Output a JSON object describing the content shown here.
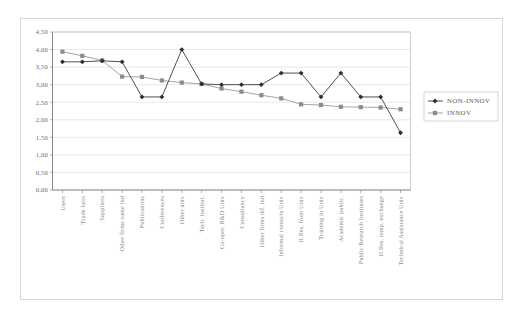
{
  "chart_data": {
    "type": "line",
    "title": "",
    "subtitle": "",
    "xlabel": "",
    "ylabel": "",
    "ylim": [
      0,
      4.5
    ],
    "ytick_labels": [
      "0,00",
      "0,50",
      "1,00",
      "1,50",
      "2,00",
      "2,50",
      "3,00",
      "3,50",
      "4,00",
      "4,50"
    ],
    "ytick_values": [
      0,
      0.5,
      1.0,
      1.5,
      2.0,
      2.5,
      3.0,
      3.5,
      4.0,
      4.5
    ],
    "grid": true,
    "legend_position": "right",
    "decimal_separator": ",",
    "categories": [
      "Users",
      "Trade fairs",
      "Suppliers",
      "Other firms same ind",
      "Publications",
      "Conferences",
      "Other univ",
      "Tech. Institut.",
      "Co-oper. R&D Univ",
      "Consultancy",
      "Other firms dif. ind",
      "Informal contacts Univ",
      "H.Res. from Univ",
      "Training in Univ",
      "Academic public.",
      "Public Research Institutes",
      "H.Res. temp. exchange",
      "Technical Assistance Univ"
    ],
    "series": [
      {
        "name": "NON-INNOV",
        "marker": "diamond",
        "color": "#2e2e2e",
        "values": [
          3.65,
          3.65,
          3.68,
          3.65,
          2.65,
          2.65,
          4.0,
          3.02,
          3.0,
          3.0,
          3.0,
          3.33,
          3.33,
          2.65,
          3.33,
          2.65,
          2.65,
          1.63
        ]
      },
      {
        "name": "INNOV",
        "marker": "square",
        "color": "#8c8c8c",
        "values": [
          3.94,
          3.82,
          3.69,
          3.23,
          3.22,
          3.12,
          3.06,
          3.02,
          2.89,
          2.8,
          2.7,
          2.61,
          2.44,
          2.42,
          2.37,
          2.36,
          2.35,
          2.3
        ]
      }
    ]
  },
  "legend": {
    "entries": [
      {
        "label": "NON-INNOV",
        "marker": "diamond-marker-icon"
      },
      {
        "label": "INNOV",
        "marker": "square-marker-icon"
      }
    ]
  }
}
